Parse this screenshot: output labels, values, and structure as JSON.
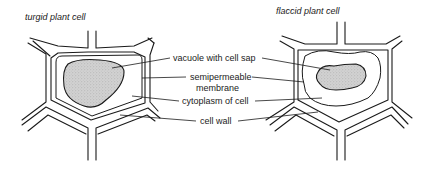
{
  "diagram": {
    "cells": [
      {
        "id": "turgid",
        "title": "turgid plant cell"
      },
      {
        "id": "flaccid",
        "title": "flaccid plant cell"
      }
    ],
    "labels": {
      "vacuole": "vacuole with cell sap",
      "membrane_line1": "semipermeable",
      "membrane_line2": "membrane",
      "cytoplasm": "cytoplasm of cell",
      "cell_wall": "cell wall"
    },
    "colors": {
      "line": "#1a1a1a",
      "vacuole_fill": "#c8c8c8",
      "background": "#ffffff"
    }
  }
}
